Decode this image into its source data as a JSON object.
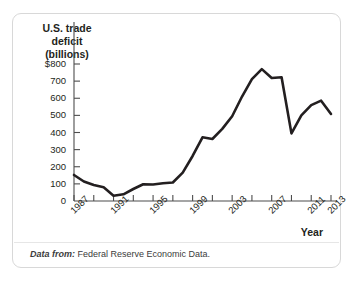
{
  "figure": {
    "y_axis_title_lines": [
      "U.S. trade",
      "deficit",
      "(billions)"
    ],
    "x_axis_title": "Year",
    "source_prefix": "Data from:",
    "source_text": "Federal Reserve Economic Data.",
    "line_color": "#231f20",
    "frame_color": "#d8d8d8",
    "axis_color": "#4d4d4d"
  },
  "chart_data": {
    "type": "line",
    "title": "",
    "xlabel": "Year",
    "ylabel": "U.S. trade deficit (billions)",
    "ylim": [
      0,
      800
    ],
    "xlim": [
      1987,
      2013
    ],
    "grid": false,
    "legend": "none",
    "ytick_labels": [
      "$800",
      "700",
      "600",
      "500",
      "400",
      "300",
      "200",
      "100",
      "0"
    ],
    "ytick_values": [
      800,
      700,
      600,
      500,
      400,
      300,
      200,
      100,
      0
    ],
    "xtick_labels": [
      "1987",
      "1991",
      "1995",
      "1999",
      "2003",
      "2007",
      "2011",
      "2013"
    ],
    "xtick_values": [
      1987,
      1991,
      1995,
      1999,
      2003,
      2007,
      2011,
      2013
    ],
    "x": [
      1987,
      1988,
      1989,
      1990,
      1991,
      1992,
      1993,
      1994,
      1995,
      1996,
      1997,
      1998,
      1999,
      2000,
      2001,
      2002,
      2003,
      2004,
      2005,
      2006,
      2007,
      2008,
      2009,
      2010,
      2011,
      2012,
      2013
    ],
    "values": [
      152,
      114,
      93,
      80,
      31,
      39,
      70,
      98,
      96,
      104,
      108,
      166,
      263,
      372,
      362,
      421,
      495,
      610,
      712,
      770,
      718,
      723,
      395,
      500,
      560,
      586,
      508
    ],
    "series": [
      {
        "name": "U.S. trade deficit (billions)",
        "values": [
          152,
          114,
          93,
          80,
          31,
          39,
          70,
          98,
          96,
          104,
          108,
          166,
          263,
          372,
          362,
          421,
          495,
          610,
          712,
          770,
          718,
          723,
          395,
          500,
          560,
          586,
          508
        ]
      }
    ]
  }
}
